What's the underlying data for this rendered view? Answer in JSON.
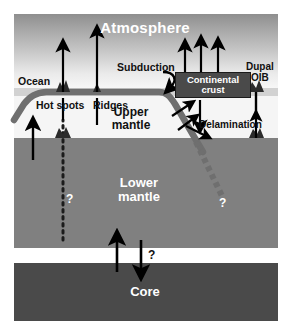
{
  "diagram": {
    "layers": [
      {
        "name": "atmosphere",
        "label": "Atmosphere",
        "color": "#9a9a9a",
        "text_color": "#ffffff"
      },
      {
        "name": "ocean",
        "label": "Ocean",
        "color": "#d2d2d2",
        "text_color": "#111111"
      },
      {
        "name": "upper_mantle",
        "label_line1": "Upper",
        "label_line2": "mantle",
        "color": "#f5f5f5",
        "text_color": "#111111"
      },
      {
        "name": "lower_mantle",
        "label_line1": "Lower",
        "label_line2": "mantle",
        "color": "#808080",
        "text_color": "#ffffff"
      },
      {
        "name": "core",
        "label": "Core",
        "color": "#4a4a4a",
        "text_color": "#ffffff"
      }
    ],
    "labels": {
      "atmosphere": "Atmosphere",
      "ocean": "Ocean",
      "hot_spots": "Hot spots",
      "ridges": "Ridges",
      "subduction": "Subduction",
      "dupal_line1": "Dupal",
      "dupal_line2": "OIB",
      "continental_crust_line1": "Continental",
      "continental_crust_line2": "crust",
      "delamination": "Delamination",
      "upper_mantle_line1": "Upper",
      "upper_mantle_line2": "mantle",
      "lower_mantle_line1": "Lower",
      "lower_mantle_line2": "mantle",
      "core": "Core"
    },
    "question_marks": {
      "plume": "?",
      "slab": "?",
      "core": "?"
    },
    "colors": {
      "atmosphere_top": "#8f8f8f",
      "atmosphere_bottom": "#f7f7f7",
      "ocean": "#d2d2d2",
      "upper_mantle": "#f5f5f5",
      "lower_mantle": "#808080",
      "core": "#4a4a4a",
      "plate": "#6f6f6f",
      "crust_box": "#4a4a4a",
      "arrow": "#000000",
      "volcano": "#2b2b2b",
      "background": "#ffffff"
    },
    "features": {
      "lithosphere_plate": "thick gray slab bending down at subduction zone",
      "slab_dashed_continuation": "dashed gray blocks descending into lower mantle",
      "plume_dotted": "dotted vertical line rising from lower mantle to hot spots",
      "arrow_count_up_atmosphere": 6,
      "arrow_count_down": 3
    }
  }
}
